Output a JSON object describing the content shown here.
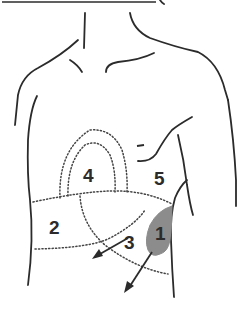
{
  "diagram": {
    "type": "anatomical-torso-regions",
    "colors": {
      "outline": "#2b2b2b",
      "shaded_region": "#8c8c8c",
      "background": "#ffffff"
    },
    "regions": [
      {
        "id": 1,
        "label": "1",
        "shaded": true
      },
      {
        "id": 2,
        "label": "2",
        "shaded": false
      },
      {
        "id": 3,
        "label": "3",
        "shaded": false
      },
      {
        "id": 4,
        "label": "4",
        "shaded": false
      },
      {
        "id": 5,
        "label": "5",
        "shaded": false
      }
    ],
    "marks": {
      "dash_mark": "-"
    },
    "arrows": [
      {
        "from": "region-3",
        "direction": "down-left"
      },
      {
        "from": "region-1",
        "direction": "down-left"
      }
    ]
  }
}
